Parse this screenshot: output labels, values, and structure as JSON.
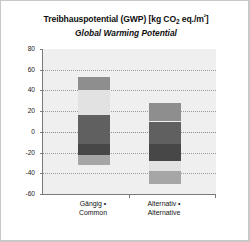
{
  "chart_data": {
    "type": "bar",
    "title": "Treibhauspotential (GWP) [kg CO2 eq./m²]",
    "title_parts": {
      "pre": "Treibhauspotential (GWP) [kg CO",
      "sub": "2",
      "mid": " eq./m",
      "sup": "²",
      "post": "]"
    },
    "subtitle": "Global Warming Potential",
    "xlabel": "",
    "ylabel": "",
    "ylim": [
      -60,
      80
    ],
    "yticks": [
      80,
      60,
      40,
      20,
      0,
      -20,
      -40,
      -60
    ],
    "ytick_labels": [
      "80",
      "60",
      "40",
      "20",
      "0",
      "-20",
      "-40",
      "-60"
    ],
    "grid": true,
    "legend": "none",
    "stacked": true,
    "categories": [
      "Gängig • Common",
      "Alternativ • Alternative"
    ],
    "category_labels": [
      {
        "line1": "Gängig •",
        "line2": "Common"
      },
      {
        "line1": "Alternativ •",
        "line2": "Alternative"
      }
    ],
    "series": [
      {
        "name": "segment-1",
        "color": "#8e8e8e",
        "values": [
          13,
          18
        ],
        "ranges": [
          [
            40,
            53
          ],
          [
            10,
            28
          ]
        ]
      },
      {
        "name": "segment-2",
        "color": "#e2e2e2",
        "values": [
          24,
          0
        ],
        "ranges": [
          [
            16,
            40
          ],
          [
            0,
            0
          ]
        ]
      },
      {
        "name": "segment-3",
        "color": "#606060",
        "values": [
          28,
          22
        ],
        "ranges": [
          [
            -12,
            16
          ],
          [
            -12,
            10
          ]
        ]
      },
      {
        "name": "segment-4",
        "color": "#474747",
        "values": [
          10,
          16
        ],
        "ranges": [
          [
            -22,
            -12
          ],
          [
            -28,
            -12
          ]
        ]
      },
      {
        "name": "segment-5",
        "color": "#e2e2e2",
        "values": [
          0,
          10
        ],
        "ranges": [
          [
            0,
            0
          ],
          [
            -38,
            -28
          ]
        ]
      },
      {
        "name": "segment-6",
        "color": "#a6a6a6",
        "values": [
          10,
          12
        ],
        "ranges": [
          [
            -32,
            -22
          ],
          [
            -50,
            -38
          ]
        ]
      }
    ],
    "totals_positive": [
      53,
      28
    ],
    "totals_negative": [
      -32,
      -50
    ],
    "plot_background": "#efefef",
    "axis_color": "#7a7a7a",
    "gridline_color": "#9a9a9a"
  }
}
